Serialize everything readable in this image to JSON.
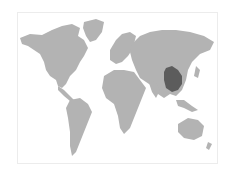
{
  "map": {
    "type": "world-map",
    "land_color": "#b3b3b3",
    "highlight_color": "#5c5c5c",
    "background_color": "#ffffff",
    "highlighted_region": "Southern China"
  }
}
